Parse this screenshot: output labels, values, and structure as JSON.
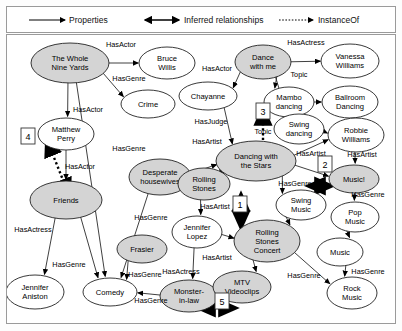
{
  "legend": {
    "items": [
      {
        "label": "Properties",
        "style": "solid-arrow",
        "x": 60
      },
      {
        "label": "Inferred relationships",
        "style": "solid-double-arrow",
        "x": 175
      },
      {
        "label": "InstanceOf",
        "style": "dotted-arrow",
        "x": 310
      }
    ]
  },
  "graph": {
    "nodes": [
      {
        "id": "whole9",
        "label1": "The Whole",
        "label2": "Nine Yards",
        "cx": 71,
        "cy": 62,
        "rx": 39,
        "ry": 20,
        "shaded": true
      },
      {
        "id": "bruce",
        "label1": "Bruce",
        "label2": "Willis",
        "cx": 168,
        "cy": 62,
        "rx": 28,
        "ry": 16,
        "shaded": false
      },
      {
        "id": "crime",
        "label1": "Crime",
        "label2": "",
        "cx": 149,
        "cy": 103,
        "rx": 27,
        "ry": 14,
        "shaded": false
      },
      {
        "id": "matthew",
        "label1": "Matthew",
        "label2": "Perry",
        "cx": 67,
        "cy": 133,
        "rx": 28,
        "ry": 16,
        "shaded": false
      },
      {
        "id": "friends",
        "label1": "Friends",
        "label2": "",
        "cx": 67,
        "cy": 199,
        "rx": 36,
        "ry": 19,
        "shaded": true
      },
      {
        "id": "jen_an",
        "label1": "Jennifer",
        "label2": "Aniston",
        "cx": 36,
        "cy": 291,
        "rx": 29,
        "ry": 17,
        "shaded": false
      },
      {
        "id": "comedy",
        "label1": "Comedy",
        "label2": "",
        "cx": 111,
        "cy": 291,
        "rx": 27,
        "ry": 14,
        "shaded": false
      },
      {
        "id": "frasier",
        "label1": "Frasier",
        "label2": "",
        "cx": 143,
        "cy": 248,
        "rx": 25,
        "ry": 14,
        "shaded": true
      },
      {
        "id": "desperate",
        "label1": "Desperate",
        "label2": "housewives",
        "cx": 161,
        "cy": 176,
        "rx": 31,
        "ry": 18,
        "shaded": true
      },
      {
        "id": "monster",
        "label1": "Monster-",
        "label2": "in-law",
        "cx": 190,
        "cy": 295,
        "rx": 29,
        "ry": 16,
        "shaded": true
      },
      {
        "id": "chayanne",
        "label1": "Chayanne",
        "label2": "",
        "cx": 209,
        "cy": 95,
        "rx": 29,
        "ry": 14,
        "shaded": false
      },
      {
        "id": "dancewith",
        "label1": "Dance",
        "label2": "with me",
        "cx": 264,
        "cy": 61,
        "rx": 28,
        "ry": 17,
        "shaded": true
      },
      {
        "id": "vanessa",
        "label1": "Vanessa",
        "label2": "Williams",
        "cx": 351,
        "cy": 60,
        "rx": 29,
        "ry": 17,
        "shaded": false
      },
      {
        "id": "mambo",
        "label1": "Mambo",
        "label2": "dancing",
        "cx": 290,
        "cy": 101,
        "rx": 25,
        "ry": 15,
        "shaded": false
      },
      {
        "id": "ballroom",
        "label1": "Ballroom",
        "label2": "Dancing",
        "cx": 351,
        "cy": 101,
        "rx": 28,
        "ry": 16,
        "shaded": false
      },
      {
        "id": "swingd",
        "label1": "Swing",
        "label2": "dancing",
        "cx": 300,
        "cy": 128,
        "rx": 25,
        "ry": 15,
        "shaded": false
      },
      {
        "id": "robbie",
        "label1": "Robbie",
        "label2": "Williams",
        "cx": 357,
        "cy": 134,
        "rx": 28,
        "ry": 17,
        "shaded": false
      },
      {
        "id": "dws",
        "label1": "Dancing with",
        "label2": "the Stars",
        "cx": 257,
        "cy": 160,
        "rx": 40,
        "ry": 20,
        "shaded": true
      },
      {
        "id": "music_ex",
        "label1": "Music!",
        "label2": "",
        "cx": 355,
        "cy": 178,
        "rx": 25,
        "ry": 14,
        "shaded": true
      },
      {
        "id": "rolling",
        "label1": "Rolling",
        "label2": "Stones",
        "cx": 205,
        "cy": 183,
        "rx": 26,
        "ry": 16,
        "shaded": true
      },
      {
        "id": "swingm",
        "label1": "Swing",
        "label2": "Music",
        "cx": 302,
        "cy": 204,
        "rx": 25,
        "ry": 15,
        "shaded": false
      },
      {
        "id": "popm",
        "label1": "Pop",
        "label2": "Music",
        "cx": 356,
        "cy": 216,
        "rx": 24,
        "ry": 15,
        "shaded": false
      },
      {
        "id": "jen_lo",
        "label1": "Jennifer",
        "label2": "Lopez",
        "cx": 198,
        "cy": 231,
        "rx": 25,
        "ry": 16,
        "shaded": false
      },
      {
        "id": "rsconcert",
        "label1": "Rolling",
        "label2": "Stones",
        "label3": "Concert",
        "cx": 268,
        "cy": 240,
        "rx": 33,
        "ry": 21,
        "shaded": true
      },
      {
        "id": "music",
        "label1": "Music",
        "label2": "",
        "cx": 341,
        "cy": 251,
        "rx": 23,
        "ry": 14,
        "shaded": false
      },
      {
        "id": "mtv",
        "label1": "MTV",
        "label2": "Videoclips",
        "cx": 243,
        "cy": 286,
        "rx": 29,
        "ry": 16,
        "shaded": true
      },
      {
        "id": "rockm",
        "label1": "Rock",
        "label2": "Music",
        "cx": 353,
        "cy": 292,
        "rx": 25,
        "ry": 16,
        "shaded": false
      }
    ],
    "edge_labels": [
      {
        "text": "HasActor",
        "x": 122,
        "y": 46
      },
      {
        "text": "HasGenre",
        "x": 130,
        "y": 80
      },
      {
        "text": "HasActor",
        "x": 89,
        "y": 111
      },
      {
        "text": "HasActor",
        "x": 81,
        "y": 168
      },
      {
        "text": "HasGenre",
        "x": 130,
        "y": 150
      },
      {
        "text": "HasActress",
        "x": 34,
        "y": 231
      },
      {
        "text": "HasGenre",
        "x": 70,
        "y": 266
      },
      {
        "text": "HasGenre",
        "x": 152,
        "y": 219
      },
      {
        "text": "HasGenre",
        "x": 146,
        "y": 276
      },
      {
        "text": "HasGenre",
        "x": 152,
        "y": 302
      },
      {
        "text": "HasActor",
        "x": 218,
        "y": 70
      },
      {
        "text": "HasJudge",
        "x": 212,
        "y": 123
      },
      {
        "text": "HasArtist",
        "x": 208,
        "y": 143
      },
      {
        "text": "HasActress",
        "x": 307,
        "y": 44
      },
      {
        "text": "Topic",
        "x": 300,
        "y": 76
      },
      {
        "text": "Topic",
        "x": 264,
        "y": 133
      },
      {
        "text": "HasArtist",
        "x": 312,
        "y": 155
      },
      {
        "text": "HasArtist",
        "x": 363,
        "y": 156
      },
      {
        "text": "HasGenre",
        "x": 296,
        "y": 185
      },
      {
        "text": "HasGenre",
        "x": 369,
        "y": 196
      },
      {
        "text": "HasArtist",
        "x": 216,
        "y": 208
      },
      {
        "text": "HasArtist",
        "x": 218,
        "y": 259
      },
      {
        "text": "HasActress",
        "x": 182,
        "y": 273
      },
      {
        "text": "HasGenre",
        "x": 305,
        "y": 277
      },
      {
        "text": "HasGenre",
        "x": 369,
        "y": 273
      }
    ],
    "inferred_boxes": [
      {
        "num": "4",
        "x": 29,
        "y": 135
      },
      {
        "num": "3",
        "x": 264,
        "y": 110
      },
      {
        "num": "2",
        "x": 326,
        "y": 163
      },
      {
        "num": "1",
        "x": 241,
        "y": 203
      },
      {
        "num": "5",
        "x": 223,
        "y": 300
      }
    ]
  }
}
